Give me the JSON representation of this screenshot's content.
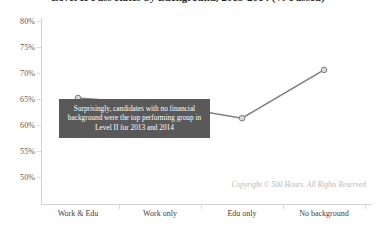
{
  "chart_data": {
    "type": "line",
    "title": "Level II Pass Rates by Background, 2013-2014 (% Passed)",
    "xlabel": "",
    "ylabel": "",
    "categories": [
      "Work & Edu",
      "Work only",
      "Edu only",
      "No background"
    ],
    "values": [
      70.2,
      69.0,
      66.3,
      75.6
    ],
    "ylim": [
      50,
      80
    ],
    "yticks": [
      "50%",
      "55%",
      "60%",
      "65%",
      "70%",
      "75%",
      "80%"
    ],
    "ytick_values": [
      50,
      55,
      60,
      65,
      70,
      75,
      80
    ],
    "grid": false,
    "legend": "none",
    "series_color": "#7f7f7f",
    "marker": "circle",
    "annotations": [
      {
        "name": "insight-callout",
        "text": "Surprisingly, candidates with no financial background were the top performing group in Level II for 2013 and 2014",
        "background_color": "#595959",
        "text_color": "#ffffff"
      }
    ],
    "footer": "Copyright © 500 Hours. All Rights Reserved"
  },
  "axis": {
    "y_labels": [
      "80%",
      "75%",
      "70%",
      "65%",
      "60%",
      "55%",
      "50%"
    ],
    "x_labels": [
      "Work & Edu",
      "Work only",
      "Edu only",
      "No background"
    ]
  },
  "colors": {
    "line": "#7f7f7f",
    "marker_fill": "#d9d9d9",
    "marker_stroke": "#7f7f7f",
    "axis": "#d4d4d4",
    "callout_bg": "#595959",
    "text": "#3d3d3d",
    "muted_text": "#b9b9b9"
  }
}
